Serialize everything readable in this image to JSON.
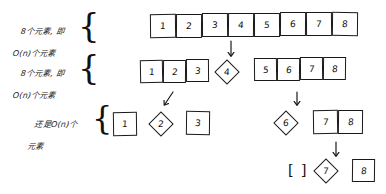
{
  "diagram": {
    "background_color": "#ffffff",
    "ink_color": "#1a1a1a",
    "annotations": [
      {
        "id": "note-1",
        "line1": "8个元素, 即",
        "line2": "O(n)个元素"
      },
      {
        "id": "note-2",
        "line1": "8个元素, 即",
        "line2": "O(n)个元素"
      },
      {
        "id": "note-3",
        "line1": "还是O(n)个",
        "line2": "元素"
      }
    ],
    "braces": [
      {
        "id": "brace-1",
        "glyph": "{"
      },
      {
        "id": "brace-2",
        "glyph": "{"
      },
      {
        "id": "brace-3",
        "glyph": "{"
      }
    ],
    "rows": [
      {
        "id": "row-1",
        "groups": [
          {
            "id": "row1-array",
            "shape": "box",
            "values": [
              "1",
              "2",
              "3",
              "4",
              "5",
              "6",
              "7",
              "8"
            ]
          }
        ]
      },
      {
        "id": "row-2",
        "groups": [
          {
            "id": "row2-left",
            "shape": "box",
            "values": [
              "1",
              "2",
              "3"
            ]
          },
          {
            "id": "row2-pivot",
            "shape": "diamond",
            "values": [
              "4"
            ]
          },
          {
            "id": "row2-right",
            "shape": "box",
            "values": [
              "5",
              "6",
              "7",
              "8"
            ]
          }
        ]
      },
      {
        "id": "row-3",
        "groups": [
          {
            "id": "row3-left-box-a",
            "shape": "box",
            "values": [
              "1"
            ]
          },
          {
            "id": "row3-left-pivot",
            "shape": "diamond",
            "values": [
              "2"
            ]
          },
          {
            "id": "row3-left-box-b",
            "shape": "box",
            "values": [
              "3"
            ]
          },
          {
            "id": "row3-right-pivot",
            "shape": "diamond",
            "values": [
              "6"
            ]
          },
          {
            "id": "row3-right-box",
            "shape": "box",
            "values": [
              "7",
              "8"
            ]
          }
        ]
      },
      {
        "id": "row-4",
        "groups": [
          {
            "id": "row4-empty",
            "shape": "empty-bracket",
            "values": [
              "[",
              "]"
            ]
          },
          {
            "id": "row4-pivot",
            "shape": "diamond",
            "values": [
              "7"
            ]
          },
          {
            "id": "row4-box",
            "shape": "box",
            "values": [
              "8"
            ]
          }
        ]
      }
    ],
    "arrows": [
      {
        "id": "arrow-1",
        "from": "row-1",
        "to": "row-2",
        "direction": "down"
      },
      {
        "id": "arrow-2",
        "from": "row-2-left",
        "to": "row-3-left",
        "direction": "down-left"
      },
      {
        "id": "arrow-3",
        "from": "row-2-right",
        "to": "row-3-right",
        "direction": "down"
      },
      {
        "id": "arrow-4",
        "from": "row-3-right",
        "to": "row-4",
        "direction": "down"
      }
    ]
  }
}
